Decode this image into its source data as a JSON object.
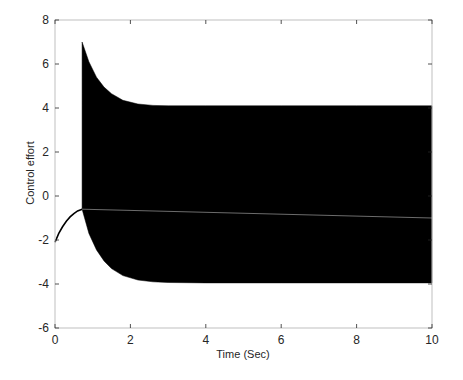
{
  "chart_data": {
    "type": "line",
    "title": "",
    "xlabel": "Time (Sec)",
    "ylabel": "Control effort",
    "xlim": [
      0,
      10
    ],
    "ylim": [
      -6,
      8
    ],
    "xticks": [
      0,
      2,
      4,
      6,
      8,
      10
    ],
    "yticks": [
      -6,
      -4,
      -2,
      0,
      2,
      4,
      6,
      8
    ],
    "grid": false,
    "legend": null,
    "series": [
      {
        "name": "control effort (pre-switch)",
        "x": [
          0,
          0.1,
          0.2,
          0.3,
          0.4,
          0.5,
          0.6,
          0.72
        ],
        "y": [
          -2.1,
          -1.7,
          -1.4,
          -1.15,
          -0.95,
          -0.8,
          -0.68,
          -0.6
        ]
      },
      {
        "name": "upper envelope (chattering)",
        "x": [
          0.72,
          0.9,
          1.1,
          1.3,
          1.5,
          1.8,
          2.2,
          2.6,
          3.0,
          4.0,
          6.0,
          8.0,
          10.0
        ],
        "y": [
          7.0,
          6.1,
          5.4,
          4.95,
          4.65,
          4.35,
          4.18,
          4.12,
          4.1,
          4.1,
          4.1,
          4.1,
          4.1
        ]
      },
      {
        "name": "lower envelope (chattering)",
        "x": [
          0.72,
          0.9,
          1.1,
          1.3,
          1.5,
          1.8,
          2.2,
          2.6,
          3.0,
          4.0,
          6.0,
          8.0,
          10.0
        ],
        "y": [
          -0.6,
          -1.7,
          -2.45,
          -2.95,
          -3.3,
          -3.62,
          -3.82,
          -3.9,
          -3.93,
          -3.95,
          -3.95,
          -3.95,
          -3.95
        ]
      },
      {
        "name": "mean trace",
        "x": [
          0.72,
          10.0
        ],
        "y": [
          -0.6,
          -1.0
        ]
      }
    ]
  },
  "axes": {
    "xlabel": "Time (Sec)",
    "ylabel": "Control effort",
    "xtick_labels": [
      "0",
      "2",
      "4",
      "6",
      "8",
      "10"
    ],
    "ytick_labels": [
      "-6",
      "-4",
      "-2",
      "0",
      "2",
      "4",
      "6",
      "8"
    ]
  },
  "colors": {
    "line": "#000000",
    "axis": "#262626",
    "box": "#bfbfbf",
    "mean_trace": "#888888"
  }
}
